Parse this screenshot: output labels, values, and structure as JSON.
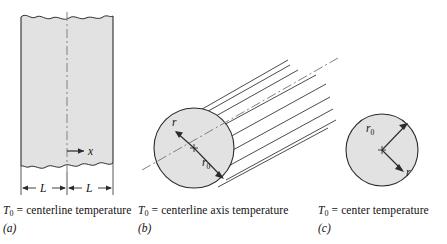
{
  "figure": {
    "title": "",
    "fill_color": "#e2e2e2",
    "line_color": "#2b2b2b",
    "panels": [
      {
        "id": "a",
        "letter": "(a)",
        "shape": "plane-wall",
        "caption_symbol": "T",
        "caption_subscript": "0",
        "caption_text": "= centerline temperature",
        "labels": {
          "coordinate": "x",
          "half_thickness_left": "L",
          "half_thickness_right": "L"
        }
      },
      {
        "id": "b",
        "letter": "(b)",
        "shape": "long-cylinder",
        "caption_symbol": "T",
        "caption_subscript": "0",
        "caption_text": "= centerline axis temperature",
        "labels": {
          "radius_variable": "r",
          "outer_radius": "r",
          "outer_radius_subscript": "0"
        }
      },
      {
        "id": "c",
        "letter": "(c)",
        "shape": "sphere",
        "caption_symbol": "T",
        "caption_subscript": "0",
        "caption_text": "= center temperature",
        "labels": {
          "radius_variable": "r",
          "outer_radius": "r",
          "outer_radius_subscript": "0"
        }
      }
    ]
  }
}
